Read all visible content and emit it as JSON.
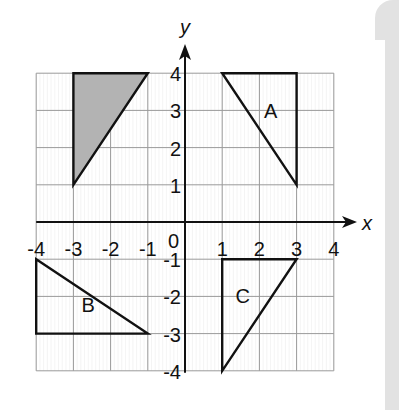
{
  "diagram": {
    "axes": {
      "x_label": "x",
      "y_label": "y",
      "origin_label": "0",
      "x_ticks": [
        "-4",
        "-3",
        "-2",
        "-1",
        "1",
        "2",
        "3",
        "4"
      ],
      "y_ticks": [
        "4",
        "3",
        "2",
        "1",
        "-1",
        "-2",
        "-3",
        "-4"
      ],
      "range": [
        -4,
        4
      ]
    },
    "shapes": [
      {
        "name": "shaded",
        "label": "",
        "points": [
          [
            -3,
            4
          ],
          [
            -1,
            4
          ],
          [
            -3,
            1
          ]
        ],
        "fill": "#b3b3b3"
      },
      {
        "name": "A",
        "label": "A",
        "points": [
          [
            1,
            4
          ],
          [
            3,
            4
          ],
          [
            3,
            1
          ]
        ],
        "fill": "none"
      },
      {
        "name": "B",
        "label": "B",
        "points": [
          [
            -4,
            -1
          ],
          [
            -4,
            -3
          ],
          [
            -1,
            -3
          ]
        ],
        "fill": "none"
      },
      {
        "name": "C",
        "label": "C",
        "points": [
          [
            1,
            -1
          ],
          [
            3,
            -1
          ],
          [
            1,
            -4
          ]
        ],
        "fill": "none"
      }
    ]
  }
}
